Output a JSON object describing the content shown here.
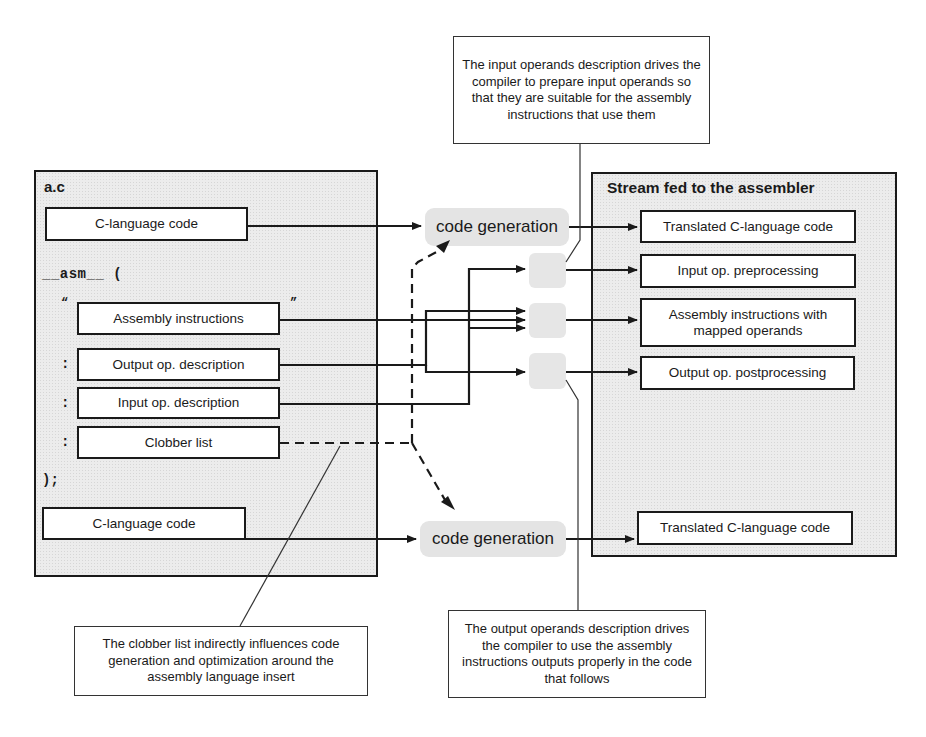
{
  "left_panel": {
    "title": "a.c",
    "c_code_top": "C-language code",
    "asm_keyword": "__asm__ (",
    "open_quote": "“",
    "close_quote": "”",
    "assembly_instructions": "Assembly instructions",
    "colon": ":",
    "output_desc": "Output op. description",
    "input_desc": "Input op. description",
    "clobber_list": "Clobber list",
    "close_paren": ");",
    "c_code_bottom": "C-language code"
  },
  "middle": {
    "code_generation_top": "code generation",
    "code_generation_bottom": "code generation"
  },
  "right_panel": {
    "title": "Stream fed to the assembler",
    "items": [
      "Translated C-language code",
      "Input op. preprocessing",
      "Assembly instructions with mapped operands",
      "Output op. postprocessing",
      "Translated C-language code"
    ]
  },
  "callouts": {
    "input": "The input operands description drives the compiler to prepare input operands so that they are suitable for the assembly instructions that use them",
    "output": "The output operands description drives the compiler to use the assembly instructions outputs properly in the code that follows",
    "clobber": "The clobber list indirectly influences code generation and optimization around the assembly language insert"
  },
  "colors": {
    "line": "#1a1a1a",
    "panel_fill": "#ececec",
    "node_fill": "#e4e4e4"
  }
}
